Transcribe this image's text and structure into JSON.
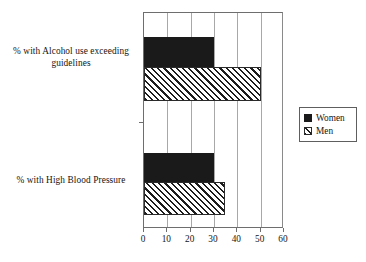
{
  "chart_data": {
    "type": "bar",
    "orientation": "horizontal",
    "title": "",
    "xlabel": "",
    "ylabel": "",
    "categories": [
      "% with Alcohol use exceeding guidelines",
      "% with High Blood Pressure"
    ],
    "series": [
      {
        "name": "Women",
        "values": [
          30,
          30
        ],
        "fill": "solid-black",
        "color": "#1a1a1a"
      },
      {
        "name": "Men",
        "values": [
          50,
          34.5
        ],
        "fill": "diagonal-hatch",
        "color": "#1d1d1d"
      }
    ],
    "xlim": [
      0,
      60
    ],
    "xticks": [
      0,
      10,
      20,
      30,
      40,
      50,
      60
    ],
    "xtick_labels": [
      "0",
      "10",
      "20",
      "30",
      "40",
      "50",
      "60"
    ],
    "grid": "vertical-gridlines",
    "legend_position": "right"
  },
  "category_labels": {
    "alcohol_line1": "% with Alcohol use exceeding",
    "alcohol_line2": "guidelines",
    "blood_pressure": "% with High Blood Pressure"
  },
  "legend": {
    "items": [
      {
        "label": "Women",
        "swatch": "solid-black-square"
      },
      {
        "label": "Men",
        "swatch": "hatched-square"
      }
    ]
  }
}
